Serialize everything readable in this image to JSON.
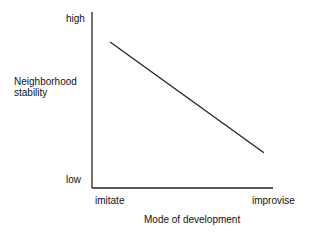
{
  "chart_data": {
    "type": "line",
    "title": "",
    "xlabel": "Mode of development",
    "ylabel": "Neighborhood stability",
    "x_tick_labels": [
      "imitate",
      "improvise"
    ],
    "y_tick_labels": [
      "low",
      "high"
    ],
    "xlim": [
      0,
      1
    ],
    "ylim": [
      0,
      1
    ],
    "grid": false,
    "series": [
      {
        "name": "relationship",
        "x": [
          0.1,
          0.95
        ],
        "y": [
          0.83,
          0.2
        ]
      }
    ]
  },
  "labels": {
    "y_high": "high",
    "y_low": "low",
    "y_title_line1": "Neighborhood",
    "y_title_line2": "stability",
    "x_left": "imitate",
    "x_right": "improvise",
    "x_title": "Mode of development"
  }
}
